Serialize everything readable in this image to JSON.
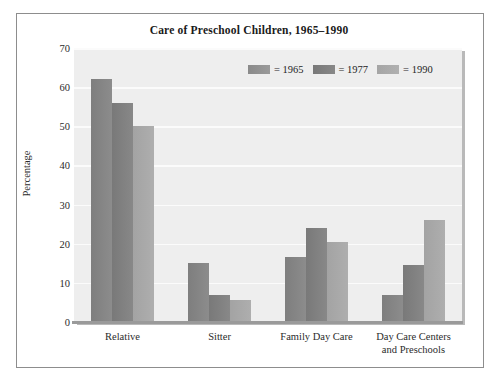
{
  "figure": {
    "title": "Care of Preschool Children, 1965–1990"
  },
  "legend": {
    "entries": [
      {
        "label": "= 1965",
        "swatch": "legend-swatch-1965",
        "color": "#8a8a8a"
      },
      {
        "label": "= 1977",
        "swatch": "legend-swatch-1977",
        "color": "#787878"
      },
      {
        "label": "= 1990",
        "swatch": "legend-swatch-1990",
        "color": "#a5a5a5"
      }
    ]
  },
  "axes": {
    "y_title": "Percentage",
    "y_ticks": [
      "0",
      "10",
      "20",
      "30",
      "40",
      "50",
      "60",
      "70"
    ],
    "x_labels": [
      {
        "line1": "Relative",
        "line2": ""
      },
      {
        "line1": "Sitter",
        "line2": ""
      },
      {
        "line1": "Family Day Care",
        "line2": ""
      },
      {
        "line1": "Day Care Centers",
        "line2": "and Preschools"
      }
    ]
  },
  "chart_data": {
    "type": "bar",
    "title": "Care of Preschool Children, 1965–1990",
    "xlabel": "",
    "ylabel": "Percentage",
    "ylim": [
      0,
      70
    ],
    "ytick_step": 10,
    "grid": true,
    "legend_position": "top-center-inside",
    "categories": [
      "Relative",
      "Sitter",
      "Family Day Care",
      "Day Care Centers and Preschools"
    ],
    "series": [
      {
        "name": "1965",
        "color": "#8a8a8a",
        "values": [
          62,
          15,
          16.5,
          7
        ]
      },
      {
        "name": "1977",
        "color": "#787878",
        "values": [
          56,
          7,
          24,
          14.5
        ]
      },
      {
        "name": "1990",
        "color": "#a5a5a5",
        "values": [
          50,
          5.5,
          20.5,
          26
        ]
      }
    ]
  }
}
